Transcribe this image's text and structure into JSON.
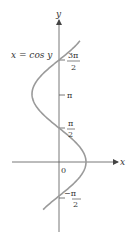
{
  "chart_data": {
    "type": "line",
    "title": "",
    "equation_label": "x = cos y",
    "xlabel": "x",
    "ylabel": "y",
    "origin_label": "0",
    "y_ticks": [
      {
        "value": -1.5708,
        "label_num": "−π",
        "label_den": "2",
        "display": "−π/2"
      },
      {
        "value": 1.5708,
        "label_num": "π",
        "label_den": "2",
        "display": "π/2"
      },
      {
        "value": 3.1416,
        "label_num": "π",
        "label_den": "",
        "display": "π"
      },
      {
        "value": 4.7124,
        "label_num": "3π",
        "label_den": "2",
        "display": "3π/2"
      }
    ],
    "series": [
      {
        "name": "x = cos y",
        "y": [
          -2.2,
          -1.5708,
          -0.7854,
          0,
          0.7854,
          1.5708,
          2.3562,
          3.1416,
          3.927,
          4.7124,
          5.4978,
          5.6
        ],
        "x": [
          -0.589,
          0,
          0.707,
          1,
          0.707,
          0,
          -0.707,
          -1,
          -0.707,
          0,
          0.707,
          0.776
        ]
      }
    ],
    "colors": {
      "curve": "#9a9a9a",
      "axes": "#555555"
    }
  }
}
